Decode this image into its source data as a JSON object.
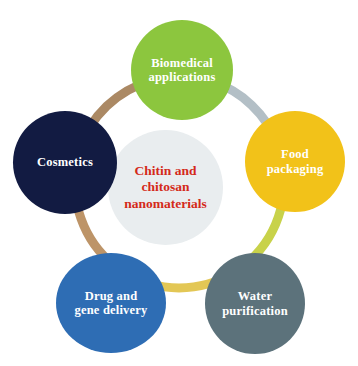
{
  "diagram": {
    "background_color": "#ffffff",
    "center": {
      "label": "Chitin and\nchitosan\nnanomaterials",
      "text_color": "#d42a1a",
      "fill_color": "#e9edef"
    },
    "nodes": [
      {
        "id": "biomedical-applications",
        "label": "Biomedical\napplications",
        "color": "#8cc63e",
        "text_color": "#ffffff",
        "position": "top"
      },
      {
        "id": "food-packaging",
        "label": "Food\npackaging",
        "color": "#f2c219",
        "text_color": "#ffffff",
        "position": "right"
      },
      {
        "id": "water-purification",
        "label": "Water\npurification",
        "color": "#5c727b",
        "text_color": "#ffffff",
        "position": "bottom-right"
      },
      {
        "id": "drug-and-gene-delivery",
        "label": "Drug and\ngene delivery",
        "color": "#2e6db4",
        "text_color": "#ffffff",
        "position": "bottom-left"
      },
      {
        "id": "cosmetics",
        "label": "Cosmetics",
        "color": "#121b42",
        "text_color": "#ffffff",
        "position": "left"
      }
    ],
    "ring_segments": [
      {
        "id": "segment-cosmetics-to-biomedical",
        "color": "#ab8964",
        "from": "cosmetics",
        "to": "biomedical-applications"
      },
      {
        "id": "segment-biomedical-to-food",
        "color": "#b3bfc6",
        "from": "biomedical-applications",
        "to": "food-packaging"
      },
      {
        "id": "segment-food-to-water",
        "color": "#c8d24a",
        "from": "food-packaging",
        "to": "water-purification"
      },
      {
        "id": "segment-water-to-drug",
        "color": "#e3c755",
        "from": "water-purification",
        "to": "drug-and-gene-delivery"
      },
      {
        "id": "segment-drug-to-cosmetics",
        "color": "#bd9468",
        "from": "drug-and-gene-delivery",
        "to": "cosmetics"
      }
    ]
  }
}
